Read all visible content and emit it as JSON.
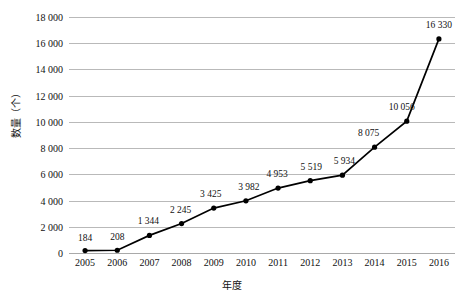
{
  "chart_data": {
    "type": "line",
    "title": "",
    "xlabel": "年度",
    "ylabel": "数量（个）",
    "categories": [
      "2005",
      "2006",
      "2007",
      "2008",
      "2009",
      "2010",
      "2011",
      "2012",
      "2013",
      "2014",
      "2015",
      "2016"
    ],
    "values": [
      184,
      208,
      1344,
      2245,
      3425,
      3982,
      4953,
      5519,
      5934,
      8075,
      10056,
      16330
    ],
    "point_labels": [
      "184",
      "208",
      "1 344",
      "2 245",
      "3 425",
      "3 982",
      "4 953",
      "5 519",
      "5 934",
      "8 075",
      "10 056",
      "16 330"
    ],
    "ylim": [
      0,
      18000
    ],
    "ytick_values": [
      0,
      2000,
      4000,
      6000,
      8000,
      10000,
      12000,
      14000,
      16000,
      18000
    ],
    "ytick_labels": [
      "0",
      "2 000",
      "4 000",
      "6 000",
      "8 000",
      "10 000",
      "12 000",
      "14 000",
      "16 000",
      "18 000"
    ],
    "grid": true,
    "legend": "none",
    "series_color": "#000000",
    "gridline_color": "#b9b9b9",
    "marker": "circle"
  }
}
